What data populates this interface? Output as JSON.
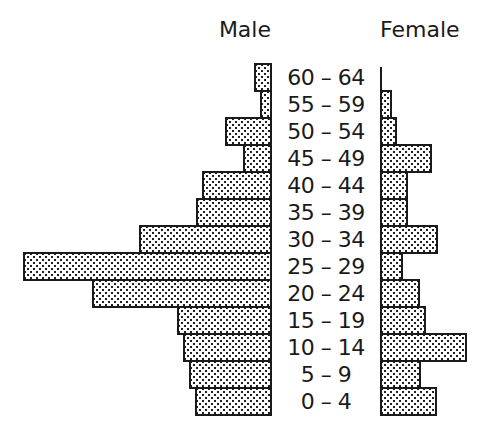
{
  "chart_data": {
    "type": "bar",
    "orientation": "horizontal",
    "subtype": "population-pyramid",
    "title": "",
    "xlabel": "",
    "ylabel": "",
    "units": "relative bar length (no scale shown)",
    "grid": false,
    "legend_position": "none",
    "side_labels": {
      "left": "Male",
      "right": "Female"
    },
    "categories": [
      "60 – 64",
      "55 – 59",
      "50 – 54",
      "45 – 49",
      "40 – 44",
      "35 – 39",
      "30 – 34",
      "25 – 29",
      "20 – 24",
      "15 – 19",
      "10 – 14",
      "5 – 9",
      "0 – 4"
    ],
    "series": [
      {
        "name": "Male",
        "side": "left",
        "values": [
          18,
          12,
          47,
          29,
          70,
          76,
          133,
          249,
          180,
          95,
          89,
          83,
          77
        ]
      },
      {
        "name": "Female",
        "side": "right",
        "values": [
          0,
          12,
          17,
          52,
          28,
          28,
          58,
          23,
          40,
          46,
          87,
          41,
          57
        ]
      }
    ],
    "fill_pattern": "dotted stipple",
    "colors": {
      "outline": "#1a1a1a",
      "fill": "#ffffff",
      "dots": "#222222"
    }
  },
  "headers": {
    "male": "Male",
    "female": "Female"
  }
}
